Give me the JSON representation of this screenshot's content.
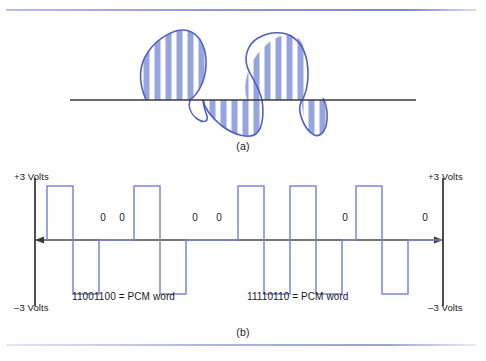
{
  "figure": {
    "panels": [
      {
        "id": "a",
        "caption": "(a)",
        "description": "analog-waveform-with-sampling-bars"
      },
      {
        "id": "b",
        "caption": "(b)",
        "description": "bipolar-pcm-pulse-train"
      }
    ]
  },
  "panel_a": {
    "caption": "(a)",
    "colors": {
      "stroke": "#5a68c8",
      "fill_stripe": "#9aa8e0",
      "baseline": "#3a3a3a"
    }
  },
  "panel_b": {
    "caption": "(b)",
    "axis": {
      "top_left_label": "+3 Volts",
      "bottom_left_label": "–3 Volts",
      "top_right_label": "+3 Volts",
      "bottom_right_label": "–3 Volts"
    },
    "word_labels": [
      {
        "text": "11001100 = PCM word"
      },
      {
        "text": "11110110 = PCM word"
      }
    ],
    "zero_labels": [
      {
        "text": "0",
        "x": 103
      },
      {
        "text": "0",
        "x": 122
      },
      {
        "text": "0",
        "x": 195
      },
      {
        "text": "0",
        "x": 219
      },
      {
        "text": "0",
        "x": 345
      },
      {
        "text": "0",
        "x": 425
      }
    ],
    "colors": {
      "pulse": "#7b86d4",
      "baseline": "#4a4a4a",
      "axis": "#3a3a3a"
    }
  },
  "chart_data": {
    "type": "line",
    "xlabel": "",
    "ylabel": "Volts",
    "ylim": [
      -3,
      3
    ],
    "grid": false,
    "legend": null,
    "bit_words": [
      "11001100",
      "11110110"
    ],
    "bits": [
      1,
      1,
      0,
      0,
      1,
      1,
      0,
      0,
      1,
      1,
      1,
      1,
      0,
      1,
      1,
      0
    ],
    "levels": [
      3,
      -3,
      0,
      0,
      3,
      -3,
      0,
      0,
      3,
      -3,
      3,
      -3,
      0,
      3,
      -3,
      0
    ],
    "annotations": [
      "+3 Volts",
      "–3 Volts",
      "11001100 = PCM word",
      "11110110 = PCM word"
    ],
    "pulses": [
      {
        "x0": 47,
        "x1": 73,
        "level": 3
      },
      {
        "x0": 73,
        "x1": 99,
        "level": -3
      },
      {
        "x0": 99,
        "x1": 112,
        "level": 0
      },
      {
        "x0": 112,
        "x1": 134,
        "level": 0
      },
      {
        "x0": 134,
        "x1": 160,
        "level": 3
      },
      {
        "x0": 160,
        "x1": 186,
        "level": -3
      },
      {
        "x0": 186,
        "x1": 208,
        "level": 0
      },
      {
        "x0": 208,
        "x1": 238,
        "level": 0
      },
      {
        "x0": 238,
        "x1": 264,
        "level": 3
      },
      {
        "x0": 264,
        "x1": 290,
        "level": -3
      },
      {
        "x0": 290,
        "x1": 316,
        "level": 3
      },
      {
        "x0": 316,
        "x1": 342,
        "level": -3
      },
      {
        "x0": 342,
        "x1": 356,
        "level": 0
      },
      {
        "x0": 356,
        "x1": 382,
        "level": 3
      },
      {
        "x0": 382,
        "x1": 408,
        "level": -3
      },
      {
        "x0": 408,
        "x1": 442,
        "level": 0
      }
    ]
  }
}
